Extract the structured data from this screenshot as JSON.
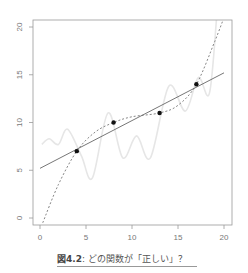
{
  "chart_data": {
    "type": "scatter",
    "title": "",
    "xlabel": "",
    "ylabel": "",
    "xlim": [
      0,
      20
    ],
    "ylim": [
      0,
      20
    ],
    "xticks": [
      0,
      5,
      10,
      15,
      20
    ],
    "yticks": [
      0,
      5,
      10,
      15,
      20
    ],
    "grid": false,
    "points": [
      {
        "x": 4,
        "y": 7
      },
      {
        "x": 8,
        "y": 10
      },
      {
        "x": 13,
        "y": 11
      },
      {
        "x": 17,
        "y": 14
      }
    ],
    "series": [
      {
        "name": "linear fit",
        "style": "solid",
        "color": "#666666",
        "x": [
          0,
          20
        ],
        "y": [
          5.2,
          15.2
        ]
      },
      {
        "name": "polynomial fit",
        "style": "dashed",
        "color": "#777777",
        "x": [
          0.3,
          2,
          4,
          6,
          8,
          10,
          13,
          15,
          17,
          19,
          20
        ],
        "y": [
          -0.5,
          3.5,
          7,
          9,
          10,
          10.6,
          11,
          11.8,
          14,
          18.5,
          21
        ]
      },
      {
        "name": "wiggly interpolation",
        "style": "solid",
        "color": "#e6e6e6",
        "x": [
          0.2,
          1,
          2,
          3,
          4.5,
          5.7,
          7.4,
          9,
          10.5,
          12,
          14,
          15.8,
          17.2,
          18.4,
          19.2
        ],
        "y": [
          7.7,
          8.3,
          7.7,
          9.3,
          6.5,
          4.2,
          11,
          6.3,
          8.6,
          6.3,
          13.8,
          11.2,
          14.7,
          13,
          21
        ]
      }
    ]
  },
  "caption": {
    "figure_number": "図4.2",
    "text": ": どの関数が「正しい」？"
  }
}
